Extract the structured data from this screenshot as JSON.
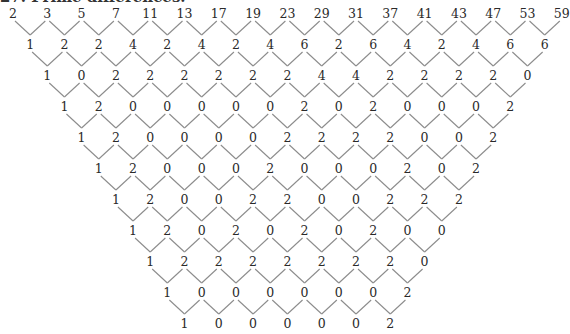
{
  "title": "27. Prime differences.",
  "layout": {
    "x0": 13,
    "col_step": 34.3,
    "row_step_y": 31,
    "y0": 13,
    "line_color": "#8c8c8c",
    "text_color": "#2a2a2a"
  },
  "rows": [
    [
      2,
      3,
      5,
      7,
      11,
      13,
      17,
      19,
      23,
      29,
      31,
      37,
      41,
      43,
      47,
      53,
      59
    ],
    [
      1,
      2,
      2,
      4,
      2,
      4,
      2,
      4,
      6,
      2,
      6,
      4,
      2,
      4,
      6,
      6
    ],
    [
      1,
      0,
      2,
      2,
      2,
      2,
      2,
      2,
      4,
      4,
      2,
      2,
      2,
      2,
      0
    ],
    [
      1,
      2,
      0,
      0,
      0,
      0,
      0,
      2,
      0,
      2,
      0,
      0,
      0,
      2
    ],
    [
      1,
      2,
      0,
      0,
      0,
      0,
      2,
      2,
      2,
      2,
      0,
      0,
      2
    ],
    [
      1,
      2,
      0,
      0,
      0,
      2,
      0,
      0,
      0,
      2,
      0,
      2
    ],
    [
      1,
      2,
      0,
      0,
      2,
      2,
      0,
      0,
      2,
      2,
      2
    ],
    [
      1,
      2,
      0,
      2,
      0,
      2,
      0,
      2,
      0,
      0
    ],
    [
      1,
      2,
      2,
      2,
      2,
      2,
      2,
      2,
      0
    ],
    [
      1,
      0,
      0,
      0,
      0,
      0,
      0,
      2
    ],
    [
      1,
      0,
      0,
      0,
      0,
      0,
      2
    ]
  ]
}
